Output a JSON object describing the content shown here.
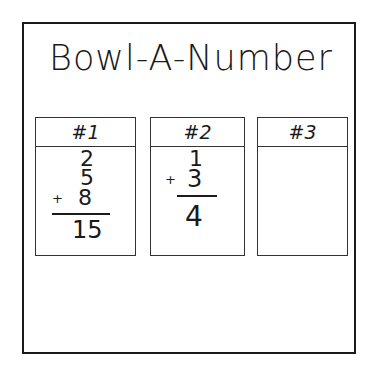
{
  "title": "Bowl-A-Number",
  "cards": [
    {
      "label": "#1",
      "addends": [
        "2",
        "5",
        "8"
      ],
      "operator": "+",
      "sum": "15"
    },
    {
      "label": "#2",
      "addends": [
        "1",
        "3"
      ],
      "operator": "+",
      "sum": "4"
    },
    {
      "label": "#3",
      "addends": [],
      "operator": "",
      "sum": ""
    }
  ]
}
